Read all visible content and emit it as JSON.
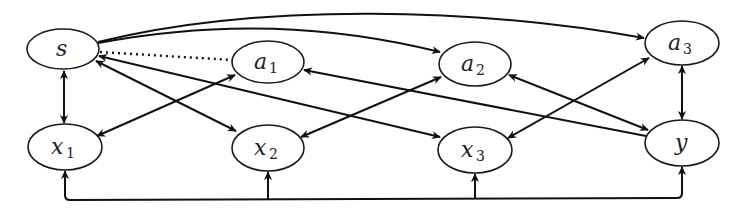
{
  "diagram": {
    "type": "causal-graph",
    "nodes": [
      {
        "id": "s",
        "base": "s",
        "sub": "",
        "cx": 63,
        "cy": 49,
        "rx": 36,
        "ry": 20
      },
      {
        "id": "a1",
        "base": "a",
        "sub": "1",
        "cx": 268,
        "cy": 62,
        "rx": 36,
        "ry": 21
      },
      {
        "id": "a2",
        "base": "a",
        "sub": "2",
        "cx": 475,
        "cy": 64,
        "rx": 36,
        "ry": 22
      },
      {
        "id": "a3",
        "base": "a",
        "sub": "3",
        "cx": 682,
        "cy": 43,
        "rx": 37,
        "ry": 22
      },
      {
        "id": "x1",
        "base": "x",
        "sub": "1",
        "cx": 65,
        "cy": 147,
        "rx": 37,
        "ry": 23
      },
      {
        "id": "x2",
        "base": "x",
        "sub": "2",
        "cx": 268,
        "cy": 148,
        "rx": 36,
        "ry": 23
      },
      {
        "id": "x3",
        "base": "x",
        "sub": "3",
        "cx": 475,
        "cy": 150,
        "rx": 37,
        "ry": 23
      },
      {
        "id": "y",
        "base": "y",
        "sub": "",
        "cx": 682,
        "cy": 143,
        "rx": 37,
        "ry": 23
      }
    ],
    "edges": [
      {
        "from": "s",
        "to": "a2",
        "style": "solid",
        "arrows": "end",
        "shape": "curve"
      },
      {
        "from": "s",
        "to": "a3",
        "style": "solid",
        "arrows": "end",
        "shape": "curve"
      },
      {
        "from": "s",
        "to": "a1",
        "style": "dotted",
        "arrows": "none",
        "shape": "line"
      },
      {
        "from": "s",
        "to": "x1",
        "style": "solid",
        "arrows": "both",
        "shape": "line"
      },
      {
        "from": "s",
        "to": "x2",
        "style": "solid",
        "arrows": "both",
        "shape": "line"
      },
      {
        "from": "s",
        "to": "x3",
        "style": "solid",
        "arrows": "both",
        "shape": "line"
      },
      {
        "from": "x1",
        "to": "a1",
        "style": "solid",
        "arrows": "both",
        "shape": "line"
      },
      {
        "from": "x2",
        "to": "a2",
        "style": "solid",
        "arrows": "both",
        "shape": "line"
      },
      {
        "from": "x3",
        "to": "a3",
        "style": "solid",
        "arrows": "both",
        "shape": "line"
      },
      {
        "from": "a1",
        "to": "y",
        "style": "solid",
        "arrows": "start",
        "shape": "line"
      },
      {
        "from": "a2",
        "to": "y",
        "style": "solid",
        "arrows": "both",
        "shape": "line"
      },
      {
        "from": "a3",
        "to": "y",
        "style": "solid",
        "arrows": "both",
        "shape": "line"
      },
      {
        "from": "bus",
        "to": [
          "x1",
          "x2",
          "x3",
          "y"
        ],
        "style": "solid",
        "arrows": "end",
        "shape": "bus"
      }
    ],
    "colors": {
      "stroke": "#111111",
      "background": "#ffffff"
    }
  }
}
